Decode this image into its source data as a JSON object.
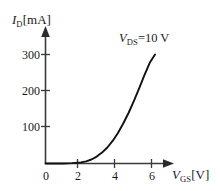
{
  "chart_data": {
    "type": "line",
    "title": "",
    "subtitle": "",
    "xlabel_plain": "VGS[V]",
    "xlabel_symbol": "V",
    "xlabel_subscript": "GS",
    "xlabel_unit": "[V]",
    "ylabel_plain": "ID[mA]",
    "ylabel_symbol": "I",
    "ylabel_subscript": "D",
    "ylabel_unit": "[mA]",
    "xlim": [
      0,
      6.9
    ],
    "ylim": [
      0,
      330
    ],
    "xticks": [
      0,
      2,
      4,
      6
    ],
    "xtick_labels": [
      "0",
      "2",
      "4",
      "6"
    ],
    "yticks": [
      100,
      200,
      300
    ],
    "ytick_labels": [
      "100",
      "200",
      "300"
    ],
    "grid": false,
    "legend_position": "upper-right-inside",
    "annotation_symbol": "V",
    "annotation_subscript": "DS",
    "annotation_rest": "=10 V",
    "annotation_text": "VDS=10 V",
    "series": [
      {
        "name": "drain current transfer characteristic",
        "color": "#111111",
        "x": [
          0.0,
          0.5,
          1.0,
          1.5,
          2.0,
          2.3,
          2.6,
          2.9,
          3.2,
          3.5,
          3.8,
          4.1,
          4.4,
          4.7,
          5.0,
          5.3,
          5.6,
          5.9,
          6.2
        ],
        "y": [
          0,
          0,
          0,
          1,
          3,
          6,
          11,
          19,
          30,
          44,
          62,
          84,
          110,
          139,
          172,
          207,
          243,
          277,
          300
        ]
      }
    ],
    "axis_color": "#3a3a3a",
    "curve_color": "#111111"
  },
  "figure": {
    "background": "#ffffff",
    "width": 220,
    "height": 191
  }
}
